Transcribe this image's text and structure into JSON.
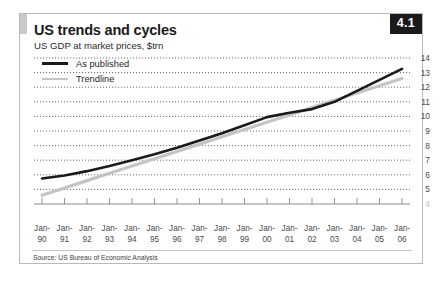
{
  "figure": {
    "number": "4.1",
    "title": "US trends and cycles",
    "subtitle": "US GDP at market prices, $trn",
    "source": "Source: US Bureau of Economic Analysis"
  },
  "legend": {
    "items": [
      {
        "label": "As published",
        "color": "#1a1a1a",
        "style": "thick-solid"
      },
      {
        "label": "Trendline",
        "color": "#c4c4c4",
        "style": "thin-solid"
      }
    ]
  },
  "colors": {
    "published_line": "#1a1a1a",
    "trendline": "#c4c4c4",
    "gridline": "#58585a",
    "axis": "#8a8a8a",
    "border": "#b9b9b9",
    "figure_badge_bg": "#1a1a1a",
    "figure_badge_text": "#ffffff",
    "accent_bar": "#c9c9c9"
  },
  "chart_data": {
    "type": "line",
    "title": "US trends and cycles",
    "subtitle": "US GDP at market prices, $trn",
    "xlabel": "",
    "ylabel": "US GDP at market prices, $trn",
    "ylim": [
      4,
      14
    ],
    "yticks": [
      14,
      13,
      12,
      11,
      10,
      9,
      8,
      7,
      6,
      5
    ],
    "ytick_labels": [
      "14",
      "13",
      "12",
      "11",
      "10",
      "9",
      "8",
      "7",
      "6",
      "5"
    ],
    "y_axis_position": "right",
    "grid": true,
    "grid_style": "dotted-horizontal",
    "legend_position": "top-left",
    "categories": [
      "Jan-90",
      "Jan-91",
      "Jan-92",
      "Jan-93",
      "Jan-94",
      "Jan-95",
      "Jan-96",
      "Jan-97",
      "Jan-98",
      "Jan-99",
      "Jan-00",
      "Jan-01",
      "Jan-02",
      "Jan-03",
      "Jan-04",
      "Jan-05",
      "Jan-06"
    ],
    "xtick_labels": [
      [
        "Jan-",
        "90"
      ],
      [
        "Jan-",
        "91"
      ],
      [
        "Jan-",
        "92"
      ],
      [
        "Jan-",
        "93"
      ],
      [
        "Jan-",
        "94"
      ],
      [
        "Jan-",
        "95"
      ],
      [
        "Jan-",
        "96"
      ],
      [
        "Jan-",
        "97"
      ],
      [
        "Jan-",
        "98"
      ],
      [
        "Jan-",
        "99"
      ],
      [
        "Jan-",
        "00"
      ],
      [
        "Jan-",
        "01"
      ],
      [
        "Jan-",
        "02"
      ],
      [
        "Jan-",
        "03"
      ],
      [
        "Jan-",
        "04"
      ],
      [
        "Jan-",
        "05"
      ],
      [
        "Jan-",
        "06"
      ]
    ],
    "series": [
      {
        "name": "As published",
        "color": "#1a1a1a",
        "values": [
          5.75,
          5.95,
          6.25,
          6.6,
          7.0,
          7.4,
          7.85,
          8.35,
          8.85,
          9.4,
          9.95,
          10.25,
          10.5,
          11.0,
          11.75,
          12.5,
          13.25
        ]
      },
      {
        "name": "Trendline",
        "color": "#c4c4c4",
        "values": [
          4.6,
          5.1,
          5.6,
          6.1,
          6.6,
          7.1,
          7.6,
          8.1,
          8.6,
          9.1,
          9.6,
          10.1,
          10.6,
          11.1,
          11.6,
          12.1,
          12.6
        ]
      }
    ]
  }
}
